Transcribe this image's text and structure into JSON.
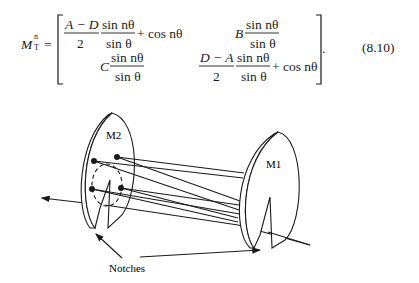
{
  "equation": {
    "lhs": "M",
    "lhs_sup": "n",
    "lhs_sub": "T",
    "equals": "=",
    "m11_num": "A − D",
    "m11_den": "2",
    "m11_sin_num": "sin nθ",
    "m11_sin_den": "sin θ",
    "m11_tail": "+ cos nθ",
    "m12_coef": "B",
    "m12_sin_num": "sin nθ",
    "m12_sin_den": "sin θ",
    "m21_coef": "C",
    "m21_sin_num": "sin nθ",
    "m21_sin_den": "sin θ",
    "m22_num": "D − A",
    "m22_den": "2",
    "m22_sin_num": "sin nθ",
    "m22_sin_den": "sin θ",
    "m22_tail": "+ cos nθ",
    "trailing": ".",
    "number": "(8.10)"
  },
  "figure": {
    "mirror_left_label": "M2",
    "mirror_right_label": "M1",
    "notches_label": "Notches"
  }
}
